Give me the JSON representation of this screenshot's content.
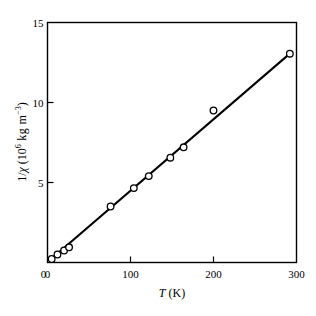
{
  "chart_data": {
    "type": "scatter",
    "title": "",
    "subtitle": "",
    "xlabel_plain": "T (K)",
    "xlabel_symbol": "T",
    "xlabel_unit": "(K)",
    "ylabel_plain": "1/χ (10^6 kg m^-3)",
    "ylabel_prefix": "1/",
    "ylabel_symbol": "χ",
    "ylabel_unit_open": " (10",
    "ylabel_unit_exp": "6",
    "ylabel_unit_mid": " kg m",
    "ylabel_unit_exp2": "−3",
    "ylabel_unit_close": ")",
    "xlim": [
      0,
      300
    ],
    "ylim": [
      0,
      15
    ],
    "xticks": [
      0,
      100,
      200,
      300
    ],
    "xtick_labels": [
      "0",
      "100",
      "200",
      "300"
    ],
    "yticks": [
      0,
      5,
      10,
      15
    ],
    "ytick_labels": [
      "0",
      "5",
      "10",
      "15"
    ],
    "grid": false,
    "legend": "none",
    "marker": "open-circle",
    "line_style": "solid",
    "line_color": "#000000",
    "marker_face_color": "#ffffff",
    "marker_edge_color": "#000000",
    "x": [
      5,
      12,
      20,
      26,
      76,
      104,
      122,
      148,
      164,
      200,
      292
    ],
    "y": [
      0.22,
      0.5,
      0.75,
      0.95,
      3.5,
      4.65,
      5.4,
      6.55,
      7.2,
      9.5,
      13.05
    ],
    "series": [
      {
        "name": "1/χ vs T",
        "points": [
          {
            "x": 5,
            "y": 0.22
          },
          {
            "x": 12,
            "y": 0.5
          },
          {
            "x": 20,
            "y": 0.75
          },
          {
            "x": 26,
            "y": 0.95
          },
          {
            "x": 76,
            "y": 3.5
          },
          {
            "x": 104,
            "y": 4.65
          },
          {
            "x": 122,
            "y": 5.4
          },
          {
            "x": 148,
            "y": 6.55
          },
          {
            "x": 164,
            "y": 7.2
          },
          {
            "x": 200,
            "y": 9.5
          },
          {
            "x": 292,
            "y": 13.05
          }
        ]
      }
    ],
    "fit_line": {
      "x_start": 4,
      "y_start": 0.2,
      "x_end": 293,
      "y_end": 13.1
    }
  }
}
